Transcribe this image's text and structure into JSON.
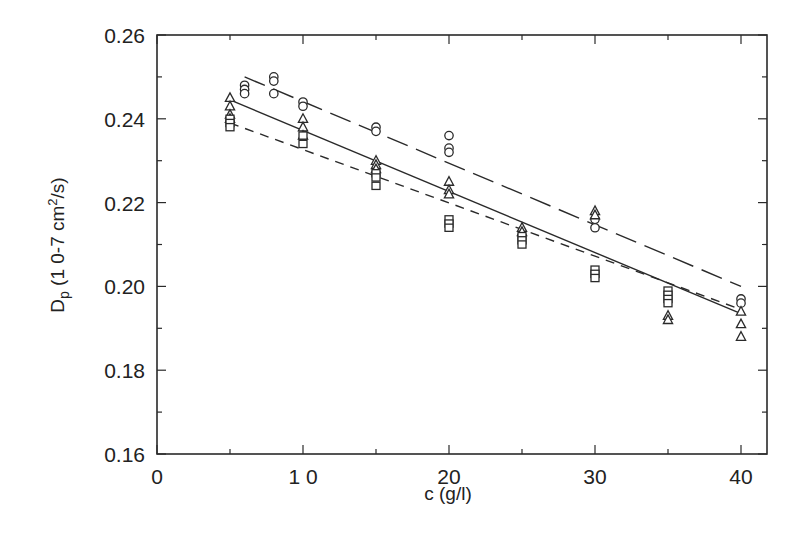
{
  "chart_data": {
    "type": "scatter",
    "title": "",
    "xlabel": "c (g/l)",
    "ylabel_parts": {
      "main": "D",
      "sub": "p",
      "unit_pre": " (1 0-7 cm",
      "sup": "2",
      "unit_post": "/s)"
    },
    "ylabel": "Dp (10-7 cm2/s)",
    "xlim": [
      0,
      42
    ],
    "ylim": [
      0.16,
      0.26
    ],
    "xticks": [
      0,
      10,
      20,
      30,
      40
    ],
    "xtick_labels": [
      "0",
      "1 0",
      "20",
      "30",
      "40"
    ],
    "xminor": [
      5,
      15,
      25,
      35
    ],
    "yticks": [
      0.16,
      0.18,
      0.2,
      0.22,
      0.24,
      0.26
    ],
    "ytick_labels": [
      "0.16",
      "0.18",
      "0.20",
      "0.22",
      "0.24",
      "0.26"
    ],
    "yminor": [
      0.17,
      0.19,
      0.21,
      0.23,
      0.25
    ],
    "grid": false,
    "legend": null,
    "series": [
      {
        "name": "circles",
        "marker": "circle",
        "points": [
          [
            6,
            0.248
          ],
          [
            6,
            0.247
          ],
          [
            6,
            0.246
          ],
          [
            8,
            0.25
          ],
          [
            8,
            0.249
          ],
          [
            8,
            0.246
          ],
          [
            10,
            0.244
          ],
          [
            10,
            0.243
          ],
          [
            15,
            0.238
          ],
          [
            15,
            0.237
          ],
          [
            20,
            0.236
          ],
          [
            20,
            0.233
          ],
          [
            20,
            0.232
          ],
          [
            30,
            0.216
          ],
          [
            30,
            0.214
          ],
          [
            40,
            0.197
          ],
          [
            40,
            0.196
          ]
        ],
        "fit": {
          "style": "long-dash",
          "x": [
            6,
            40
          ],
          "y": [
            0.25,
            0.2
          ]
        }
      },
      {
        "name": "triangles",
        "marker": "triangle",
        "points": [
          [
            5,
            0.245
          ],
          [
            5,
            0.243
          ],
          [
            5,
            0.241
          ],
          [
            5,
            0.24
          ],
          [
            10,
            0.24
          ],
          [
            10,
            0.238
          ],
          [
            10,
            0.236
          ],
          [
            15,
            0.23
          ],
          [
            15,
            0.229
          ],
          [
            15,
            0.228
          ],
          [
            20,
            0.225
          ],
          [
            20,
            0.223
          ],
          [
            20,
            0.222
          ],
          [
            25,
            0.214
          ],
          [
            25,
            0.213
          ],
          [
            30,
            0.218
          ],
          [
            30,
            0.217
          ],
          [
            35,
            0.193
          ],
          [
            35,
            0.192
          ],
          [
            40,
            0.194
          ],
          [
            40,
            0.191
          ],
          [
            40,
            0.188
          ]
        ],
        "fit": {
          "style": "solid",
          "x": [
            5,
            40
          ],
          "y": [
            0.2445,
            0.1935
          ]
        }
      },
      {
        "name": "squares",
        "marker": "square",
        "points": [
          [
            5,
            0.24
          ],
          [
            5,
            0.239
          ],
          [
            5,
            0.238
          ],
          [
            10,
            0.236
          ],
          [
            10,
            0.234
          ],
          [
            15,
            0.227
          ],
          [
            15,
            0.226
          ],
          [
            15,
            0.224
          ],
          [
            20,
            0.216
          ],
          [
            20,
            0.215
          ],
          [
            20,
            0.214
          ],
          [
            25,
            0.212
          ],
          [
            25,
            0.211
          ],
          [
            25,
            0.21
          ],
          [
            30,
            0.204
          ],
          [
            30,
            0.203
          ],
          [
            30,
            0.202
          ],
          [
            35,
            0.199
          ],
          [
            35,
            0.198
          ],
          [
            35,
            0.197
          ],
          [
            35,
            0.196
          ]
        ],
        "fit": {
          "style": "short-dash",
          "x": [
            5,
            40
          ],
          "y": [
            0.239,
            0.1945
          ]
        }
      }
    ]
  },
  "colors": {
    "ink": "#2a2a2a",
    "background": "#ffffff"
  }
}
